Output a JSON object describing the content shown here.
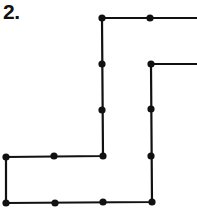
{
  "figure": {
    "label": "2.",
    "stroke_color": "#111111",
    "dot_color": "#111111",
    "background": "#ffffff"
  },
  "diagram": {
    "type": "grid-dot-path",
    "outer_path": [
      [
        197,
        18
      ],
      [
        102,
        18
      ],
      [
        103,
        156
      ],
      [
        6,
        157
      ],
      [
        6,
        203
      ],
      [
        152,
        202
      ],
      [
        151,
        64
      ],
      [
        197,
        64
      ]
    ],
    "dots": [
      [
        102,
        18
      ],
      [
        150,
        18
      ],
      [
        102,
        64
      ],
      [
        102,
        110
      ],
      [
        103,
        156
      ],
      [
        6,
        157
      ],
      [
        54,
        156
      ],
      [
        6,
        203
      ],
      [
        55,
        203
      ],
      [
        103,
        202
      ],
      [
        152,
        202
      ],
      [
        151,
        156
      ],
      [
        151,
        109
      ],
      [
        151,
        64
      ]
    ]
  }
}
